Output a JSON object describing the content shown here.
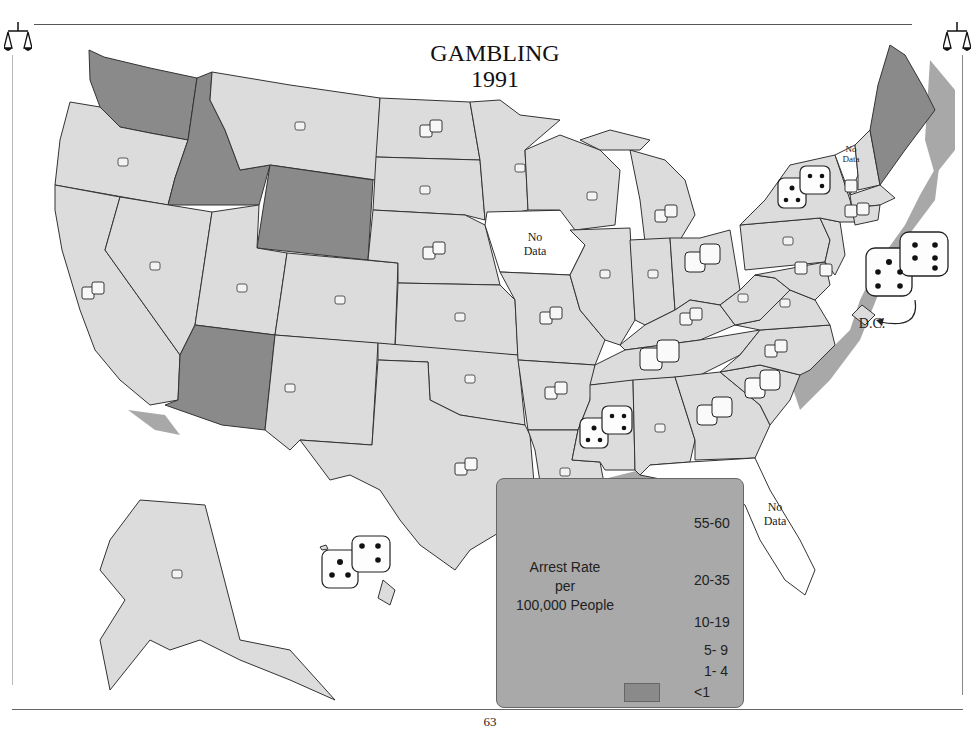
{
  "header": {
    "title_line1": "GAMBLING",
    "title_line2": "1991",
    "left_icon": "scales-of-justice-icon",
    "right_icon": "scales-of-justice-icon"
  },
  "footer": {
    "page_number": "63"
  },
  "map": {
    "type": "choropleth",
    "subject": "Gambling arrest rate per 100,000 people, 1991",
    "colors": {
      "state_fill": "#dcdcdc",
      "low_fill": "#8a8a8a",
      "no_data_fill": "#ffffff",
      "water_shadow": "#9a9a9a",
      "border": "#333333"
    },
    "labels": {
      "no_data": [
        "No",
        "Data"
      ],
      "dc": "D.C."
    },
    "states": [
      {
        "name": "Washington",
        "category": "<1"
      },
      {
        "name": "Oregon",
        "category": "1-4"
      },
      {
        "name": "California",
        "category": "5-9"
      },
      {
        "name": "Idaho",
        "category": "<1"
      },
      {
        "name": "Nevada",
        "category": "1-4"
      },
      {
        "name": "Montana",
        "category": "1-4"
      },
      {
        "name": "Wyoming",
        "category": "<1"
      },
      {
        "name": "Utah",
        "category": "1-4"
      },
      {
        "name": "Arizona",
        "category": "<1"
      },
      {
        "name": "Colorado",
        "category": "1-4"
      },
      {
        "name": "New Mexico",
        "category": "1-4"
      },
      {
        "name": "North Dakota",
        "category": "5-9"
      },
      {
        "name": "South Dakota",
        "category": "1-4"
      },
      {
        "name": "Nebraska",
        "category": "5-9"
      },
      {
        "name": "Kansas",
        "category": "1-4"
      },
      {
        "name": "Oklahoma",
        "category": "1-4"
      },
      {
        "name": "Texas",
        "category": "5-9"
      },
      {
        "name": "Minnesota",
        "category": "1-4"
      },
      {
        "name": "Iowa",
        "category": "No Data"
      },
      {
        "name": "Missouri",
        "category": "5-9"
      },
      {
        "name": "Arkansas",
        "category": "5-9"
      },
      {
        "name": "Louisiana",
        "category": "1-4"
      },
      {
        "name": "Wisconsin",
        "category": "1-4"
      },
      {
        "name": "Illinois",
        "category": "1-4"
      },
      {
        "name": "Michigan",
        "category": "5-9"
      },
      {
        "name": "Indiana",
        "category": "1-4"
      },
      {
        "name": "Ohio",
        "category": "10-19"
      },
      {
        "name": "Kentucky",
        "category": "5-9"
      },
      {
        "name": "Tennessee",
        "category": "10-19"
      },
      {
        "name": "Mississippi",
        "category": "20-35"
      },
      {
        "name": "Alabama",
        "category": "1-4"
      },
      {
        "name": "Georgia",
        "category": "10-19"
      },
      {
        "name": "Florida",
        "category": "No Data"
      },
      {
        "name": "South Carolina",
        "category": "10-19"
      },
      {
        "name": "North Carolina",
        "category": "5-9"
      },
      {
        "name": "Virginia",
        "category": "1-4"
      },
      {
        "name": "West Virginia",
        "category": "1-4"
      },
      {
        "name": "Pennsylvania",
        "category": "1-4"
      },
      {
        "name": "New York",
        "category": "20-35"
      },
      {
        "name": "Vermont",
        "category": "No Data"
      },
      {
        "name": "New Hampshire",
        "category": "1-4"
      },
      {
        "name": "Maine",
        "category": "<1"
      },
      {
        "name": "Massachusetts",
        "category": "5-9"
      },
      {
        "name": "Rhode Island",
        "category": "1-4"
      },
      {
        "name": "Connecticut",
        "category": "5-9"
      },
      {
        "name": "New Jersey",
        "category": "1-4"
      },
      {
        "name": "Delaware",
        "category": "5-9"
      },
      {
        "name": "Maryland",
        "category": "1-4"
      },
      {
        "name": "District of Columbia",
        "category": "55-60"
      },
      {
        "name": "Alaska",
        "category": "1-4"
      },
      {
        "name": "Hawaii",
        "category": "20-35"
      }
    ]
  },
  "legend": {
    "title_lines": [
      "Arrest Rate",
      "per",
      "100,000 People"
    ],
    "items": [
      {
        "label": "55-60",
        "icon": "dice-xl-icon"
      },
      {
        "label": "20-35",
        "icon": "dice-lg-icon"
      },
      {
        "label": "10-19",
        "icon": "dice-md-icon"
      },
      {
        "label": "5- 9",
        "icon": "dice-sm-icon"
      },
      {
        "label": "1- 4",
        "icon": "dice-xs-icon"
      },
      {
        "label": "<1",
        "icon": "gray-swatch"
      }
    ]
  }
}
